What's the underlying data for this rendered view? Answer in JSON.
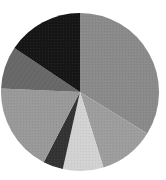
{
  "chart_data": {
    "type": "pie",
    "title": "",
    "labels": [
      "",
      "",
      "",
      "",
      "",
      "",
      ""
    ],
    "values": [
      33.8,
      11.4,
      8.3,
      4.1,
      18.1,
      8.7,
      15.6
    ],
    "colors": [
      "#8a8a8a",
      "#9d9d9d",
      "#d2d2d2",
      "#333333",
      "#999999",
      "#6a6a6a",
      "#161616"
    ],
    "start_angle_deg": 0,
    "direction": "clockwise",
    "legend": null,
    "center": [
      80,
      92
    ],
    "radius": 79
  }
}
